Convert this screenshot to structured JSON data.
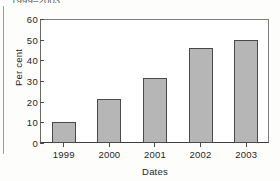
{
  "page": {
    "clipped_caption": "1999–2003."
  },
  "chart_data": {
    "type": "bar",
    "title": "",
    "categories": [
      "1999",
      "2000",
      "2001",
      "2002",
      "2003"
    ],
    "values": [
      10,
      21.5,
      31.5,
      46,
      50
    ],
    "xlabel": "Dates",
    "ylabel": "Per cent",
    "ylim": [
      0,
      60
    ],
    "yticks": [
      0,
      10,
      20,
      30,
      40,
      50,
      60
    ],
    "ytick_labels": [
      "0",
      "10",
      "20",
      "30",
      "40",
      "50",
      "60"
    ],
    "grid": false,
    "legend": false,
    "bar_fill_color": "#b6b6b6",
    "bar_edge_color": "#4a4a4a",
    "axis_color": "#4a4a4a"
  }
}
